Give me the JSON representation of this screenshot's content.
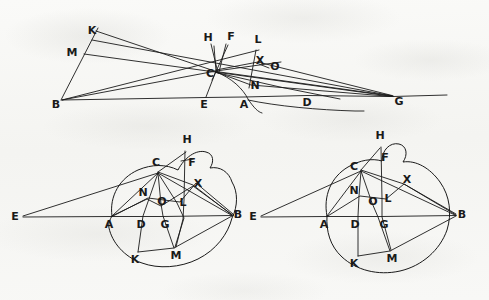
{
  "document": {
    "kind": "geometric-diagram-plate",
    "description": "Three hand-drawn geometric construction figures on aged paper",
    "background_color": "#f7f7f5",
    "ink_color": "#1a1a1a",
    "width": 489,
    "height": 300
  },
  "figures": [
    {
      "id": "figure-top",
      "name": "top-figure",
      "shape_note": "open construction with pencil of lines converging at C and G, plus an arc through C and A",
      "points": [
        {
          "label": "B",
          "x": 62,
          "y": 100,
          "label_dx": -6,
          "label_dy": 5
        },
        {
          "label": "K",
          "x": 93,
          "y": 38,
          "label_dx": -1,
          "label_dy": -7
        },
        {
          "label": "M",
          "x": 80,
          "y": 53,
          "label_dx": -8,
          "label_dy": 0
        },
        {
          "label": "E",
          "x": 205,
          "y": 97,
          "label_dx": -1,
          "label_dy": 8
        },
        {
          "label": "C",
          "x": 216,
          "y": 71,
          "label_dx": -6,
          "label_dy": 3
        },
        {
          "label": "H",
          "x": 213,
          "y": 42,
          "label_dx": -5,
          "label_dy": -4
        },
        {
          "label": "F",
          "x": 229,
          "y": 41,
          "label_dx": 2,
          "label_dy": -4
        },
        {
          "label": "A",
          "x": 244,
          "y": 97,
          "label_dx": 0,
          "label_dy": 8
        },
        {
          "label": "N",
          "x": 251,
          "y": 85,
          "label_dx": 4,
          "label_dy": 1
        },
        {
          "label": "L",
          "x": 257,
          "y": 46,
          "label_dx": 1,
          "label_dy": -6
        },
        {
          "label": "X",
          "x": 258,
          "y": 63,
          "label_dx": 2,
          "label_dy": -2
        },
        {
          "label": "O",
          "x": 271,
          "y": 67,
          "label_dx": 4,
          "label_dy": 0
        },
        {
          "label": "D",
          "x": 307,
          "y": 95,
          "label_dx": 0,
          "label_dy": 8
        },
        {
          "label": "G",
          "x": 393,
          "y": 97,
          "label_dx": 6,
          "label_dy": 5
        }
      ]
    },
    {
      "id": "figure-bottom-left",
      "name": "bottom-left-figure",
      "shape_note": "irregular hand-drawn circle through A, C, B, K with external point E on line EAB",
      "points": [
        {
          "label": "E",
          "x": 21,
          "y": 217,
          "label_dx": -6,
          "label_dy": 0
        },
        {
          "label": "A",
          "x": 112,
          "y": 216,
          "label_dx": -3,
          "label_dy": 9
        },
        {
          "label": "C",
          "x": 158,
          "y": 172,
          "label_dx": -2,
          "label_dy": -9
        },
        {
          "label": "H",
          "x": 186,
          "y": 147,
          "label_dx": 1,
          "label_dy": -7
        },
        {
          "label": "F",
          "x": 188,
          "y": 165,
          "label_dx": 4,
          "label_dy": -2
        },
        {
          "label": "X",
          "x": 193,
          "y": 184,
          "label_dx": 5,
          "label_dy": 0
        },
        {
          "label": "N",
          "x": 147,
          "y": 196,
          "label_dx": -4,
          "label_dy": -3
        },
        {
          "label": "O",
          "x": 161,
          "y": 204,
          "label_dx": 1,
          "label_dy": -2
        },
        {
          "label": "L",
          "x": 178,
          "y": 203,
          "label_dx": 5,
          "label_dy": 0
        },
        {
          "label": "D",
          "x": 143,
          "y": 216,
          "label_dx": -2,
          "label_dy": 9
        },
        {
          "label": "G",
          "x": 163,
          "y": 216,
          "label_dx": 2,
          "label_dy": 9
        },
        {
          "label": "B",
          "x": 232,
          "y": 215,
          "label_dx": 6,
          "label_dy": 0
        },
        {
          "label": "K",
          "x": 138,
          "y": 252,
          "label_dx": -3,
          "label_dy": 8
        },
        {
          "label": "M",
          "x": 174,
          "y": 248,
          "label_dx": 2,
          "label_dy": 8
        }
      ]
    },
    {
      "id": "figure-bottom-right",
      "name": "bottom-right-figure",
      "shape_note": "near-circular hand-drawn circle through A, C, B, K with external point E on line EAB",
      "points": [
        {
          "label": "E",
          "x": 259,
          "y": 217,
          "label_dx": -6,
          "label_dy": 0
        },
        {
          "label": "A",
          "x": 327,
          "y": 216,
          "label_dx": -3,
          "label_dy": 9
        },
        {
          "label": "C",
          "x": 361,
          "y": 170,
          "label_dx": -7,
          "label_dy": -3
        },
        {
          "label": "H",
          "x": 380,
          "y": 143,
          "label_dx": 0,
          "label_dy": -7
        },
        {
          "label": "F",
          "x": 382,
          "y": 161,
          "label_dx": 3,
          "label_dy": -3
        },
        {
          "label": "X",
          "x": 404,
          "y": 183,
          "label_dx": 3,
          "label_dy": -3
        },
        {
          "label": "N",
          "x": 358,
          "y": 194,
          "label_dx": -4,
          "label_dy": -3
        },
        {
          "label": "O",
          "x": 372,
          "y": 203,
          "label_dx": 1,
          "label_dy": -1
        },
        {
          "label": "L",
          "x": 384,
          "y": 200,
          "label_dx": 4,
          "label_dy": -1
        },
        {
          "label": "D",
          "x": 358,
          "y": 216,
          "label_dx": -3,
          "label_dy": 9
        },
        {
          "label": "G",
          "x": 382,
          "y": 216,
          "label_dx": 2,
          "label_dy": 9
        },
        {
          "label": "B",
          "x": 456,
          "y": 215,
          "label_dx": 6,
          "label_dy": 0
        },
        {
          "label": "K",
          "x": 358,
          "y": 256,
          "label_dx": -4,
          "label_dy": 8
        },
        {
          "label": "M",
          "x": 390,
          "y": 251,
          "label_dx": 2,
          "label_dy": 8
        }
      ]
    }
  ]
}
